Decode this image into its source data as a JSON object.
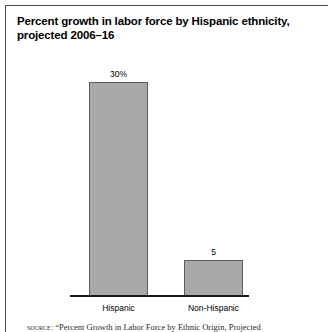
{
  "chart_data": {
    "type": "bar",
    "title": "Percent growth in labor force by Hispanic ethnicity, projected 2006–16",
    "xlabel": "",
    "ylabel": "",
    "grid": false,
    "legend": "none",
    "ylim": [
      0,
      33
    ],
    "categories": [
      "Hispanic",
      "Non-Hispanic"
    ],
    "values": [
      30,
      5
    ],
    "value_labels": [
      "30%",
      "5"
    ],
    "bar_color": "#a9a9a9",
    "bar_edge_color": "#5d5d5d",
    "axis_color": "#1a1a1a"
  },
  "figure": {
    "title": "Percent growth in labor force by Hispanic ethnicity, projected 2006–16",
    "source_label": "source:",
    "source_text": "“Percent Growth in Labor Force by Ethnic Origin, Projected"
  }
}
